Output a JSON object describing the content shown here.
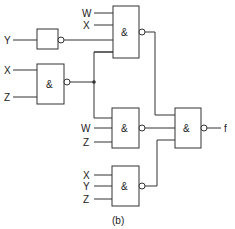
{
  "diagram": {
    "type": "logic-circuit",
    "caption": "(b)",
    "output_label": "f",
    "gate_symbol": "&",
    "inputs": {
      "gate1": [
        "W",
        "X"
      ],
      "inverter": [
        "Y"
      ],
      "gate2": [
        "X",
        "Z"
      ],
      "gate3": [
        "W",
        "Z"
      ],
      "gate4": [
        "X",
        "Y",
        "Z"
      ]
    }
  }
}
